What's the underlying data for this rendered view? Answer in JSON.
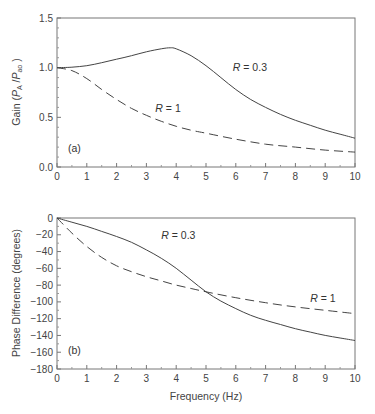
{
  "chart_data": [
    {
      "type": "line",
      "panel_label": "(a)",
      "title": "",
      "xlabel": "",
      "ylabel": "Gain (P_A / P_ao)",
      "ylabel_parts": {
        "main": "Gain (",
        "p1": "P",
        "sub1": "A",
        "slash": " /",
        "p2": "P",
        "sub2": "ao",
        "close": " )"
      },
      "xlim": [
        0,
        10
      ],
      "ylim": [
        0.0,
        1.5
      ],
      "xticks": [
        "0",
        "1",
        "2",
        "3",
        "4",
        "5",
        "6",
        "7",
        "8",
        "9",
        "10"
      ],
      "yticks": [
        "0.0",
        "0.5",
        "1.0",
        "1.5"
      ],
      "grid": false,
      "series": [
        {
          "name": "R = 0.3",
          "style": "solid",
          "x": [
            0,
            0.5,
            1,
            1.5,
            2,
            2.5,
            3,
            3.5,
            3.8,
            4,
            4.5,
            5,
            5.5,
            6,
            6.5,
            7,
            7.5,
            8,
            8.5,
            9,
            9.5,
            10
          ],
          "values": [
            1.0,
            1.005,
            1.02,
            1.05,
            1.085,
            1.12,
            1.16,
            1.19,
            1.2,
            1.19,
            1.12,
            1.02,
            0.9,
            0.78,
            0.68,
            0.6,
            0.53,
            0.47,
            0.42,
            0.37,
            0.33,
            0.29
          ]
        },
        {
          "name": "R = 1",
          "style": "dashed",
          "x": [
            0,
            0.5,
            1,
            1.5,
            2,
            2.5,
            3,
            3.5,
            4,
            4.5,
            5,
            6,
            7,
            8,
            9,
            10
          ],
          "values": [
            1.0,
            0.97,
            0.89,
            0.78,
            0.68,
            0.59,
            0.52,
            0.46,
            0.41,
            0.37,
            0.34,
            0.28,
            0.23,
            0.2,
            0.17,
            0.15
          ]
        }
      ],
      "annotations": [
        {
          "text_italic": "R",
          "text": " = 0.3",
          "x": 5.9,
          "y": 0.97
        },
        {
          "text_italic": "R",
          "text": " = 1",
          "x": 3.3,
          "y": 0.55
        }
      ]
    },
    {
      "type": "line",
      "panel_label": "(b)",
      "title": "",
      "xlabel": "Frequency (Hz)",
      "ylabel": "Phase Difference (degrees)",
      "xlim": [
        0,
        10
      ],
      "ylim": [
        -180,
        0
      ],
      "xticks": [
        "0",
        "1",
        "2",
        "3",
        "4",
        "5",
        "6",
        "7",
        "8",
        "9",
        "10"
      ],
      "yticks": [
        "0",
        "−20",
        "−40",
        "−60",
        "−80",
        "−100",
        "−120",
        "−140",
        "−160",
        "−180"
      ],
      "grid": false,
      "series": [
        {
          "name": "R = 0.3",
          "style": "solid",
          "x": [
            0,
            0.5,
            1,
            1.5,
            2,
            2.5,
            3,
            3.5,
            4,
            4.5,
            5,
            5.5,
            6,
            6.5,
            7,
            7.5,
            8,
            8.5,
            9,
            9.5,
            10
          ],
          "values": [
            0,
            -5,
            -10,
            -16,
            -22,
            -29,
            -38,
            -48,
            -60,
            -74,
            -88,
            -99,
            -108,
            -116,
            -122,
            -127,
            -132,
            -136,
            -140,
            -143,
            -146
          ]
        },
        {
          "name": "R = 1",
          "style": "dashed",
          "x": [
            0,
            0.5,
            1,
            1.5,
            2,
            2.5,
            3,
            3.5,
            4,
            4.5,
            5,
            6,
            7,
            8,
            9,
            10
          ],
          "values": [
            0,
            -18,
            -34,
            -47,
            -57,
            -64,
            -70,
            -75,
            -80,
            -84,
            -88,
            -95,
            -101,
            -106,
            -110,
            -114
          ]
        }
      ],
      "annotations": [
        {
          "text_italic": "R",
          "text": " = 0.3",
          "x": 3.5,
          "y": -25
        },
        {
          "text_italic": "R",
          "text": " = 1",
          "x": 8.5,
          "y": -100
        }
      ]
    }
  ]
}
